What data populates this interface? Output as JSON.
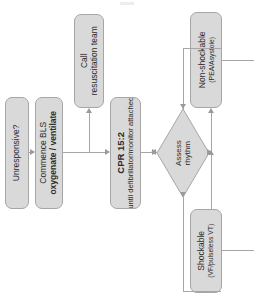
{
  "diagram": {
    "orientation": "rotated-90",
    "palette": {
      "node_fill": "#d9d9d9",
      "node_border": "#a6a6a6",
      "connector": "#a6a6a6",
      "text": "#2b2b2b",
      "background": "#ffffff"
    },
    "nodes": [
      {
        "id": "unresponsive",
        "shape": "rounded-rectangle",
        "line1": "Unresponsive?",
        "line2": ""
      },
      {
        "id": "bls",
        "shape": "rounded-rectangle",
        "line1": "Commence BLS",
        "line2": "oxygenate / ventilate"
      },
      {
        "id": "call_team",
        "shape": "rounded-rectangle",
        "line1": "Call",
        "line2": "resuscitation team"
      },
      {
        "id": "cpr",
        "shape": "rounded-rectangle",
        "line1": "CPR 15:2",
        "line2": "until defibrillator/monitor attached"
      },
      {
        "id": "assess",
        "shape": "diamond",
        "line1": "Assess",
        "line2": "rhythm"
      },
      {
        "id": "non_shockable",
        "shape": "rounded-rectangle",
        "line1": "Non-shockable",
        "line2": "(PEA/Asystole)"
      },
      {
        "id": "shockable",
        "shape": "rounded-rectangle",
        "line1": "Shockable",
        "line2": "(VF/pulseless VT)"
      }
    ],
    "edges": [
      {
        "id": "e1",
        "from": "unresponsive",
        "to": "bls",
        "label": ""
      },
      {
        "id": "e2",
        "from": "bls",
        "to": "call_team",
        "label": ""
      },
      {
        "id": "e3",
        "from": "bls",
        "to": "cpr",
        "label": ""
      },
      {
        "id": "e4",
        "from": "cpr",
        "to": "assess",
        "label": ""
      },
      {
        "id": "e5",
        "from": "assess",
        "to": "non_shockable",
        "label": ""
      },
      {
        "id": "e6",
        "from": "assess",
        "to": "shockable",
        "label": ""
      },
      {
        "id": "e7",
        "from": "non_shockable",
        "to": "assess",
        "label": ""
      },
      {
        "id": "e8",
        "from": "shockable",
        "to": "assess",
        "label": ""
      }
    ]
  }
}
